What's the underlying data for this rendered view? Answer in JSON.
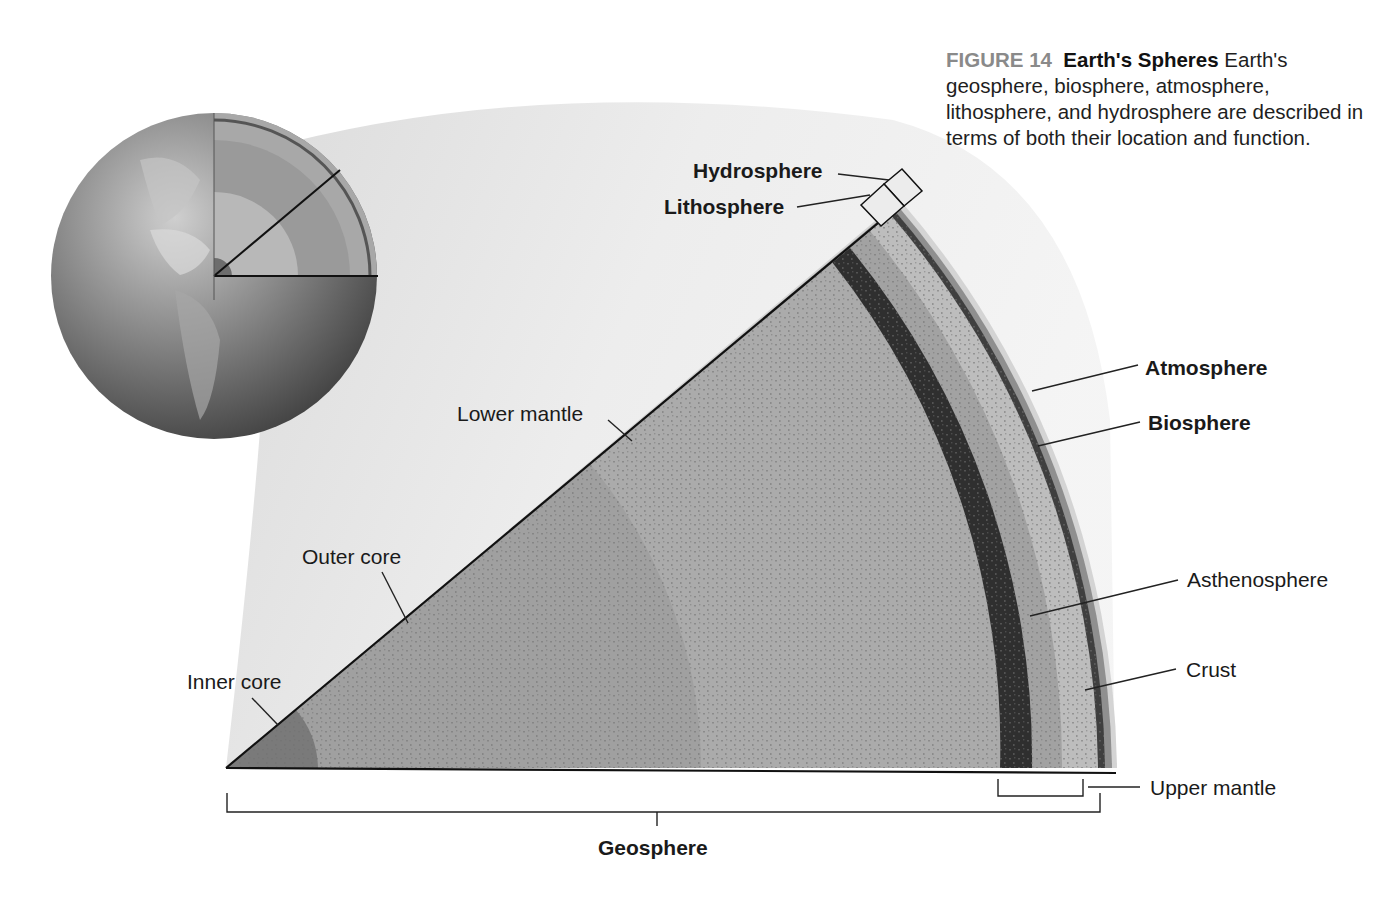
{
  "caption": {
    "figure_number": "FIGURE 14",
    "title": "Earth's Spheres",
    "text": " Earth's geosphere, biosphere, atmosphere, lithosphere, and hydrosphere are described in terms of both their location and function."
  },
  "labels": {
    "hydrosphere": "Hydrosphere",
    "lithosphere": "Lithosphere",
    "atmosphere": "Atmosphere",
    "biosphere": "Biosphere",
    "asthenosphere": "Asthenosphere",
    "crust": "Crust",
    "upper_mantle": "Upper mantle",
    "lower_mantle": "Lower mantle",
    "outer_core": "Outer core",
    "inner_core": "Inner core",
    "geosphere": "Geosphere"
  },
  "colors": {
    "lower_mantle": "#a9a9a9",
    "outer_core": "#9a9a9a",
    "inner_core": "#7c7c7c",
    "dark_band": "#3a3a3a",
    "asthenosphere": "#9e9e9e",
    "upper_light": "#bdbdbd",
    "crust": "#444444",
    "atmosphere": "#8f8f8f",
    "halo": "#e6e6e6",
    "globe": "#8c8c8c"
  }
}
